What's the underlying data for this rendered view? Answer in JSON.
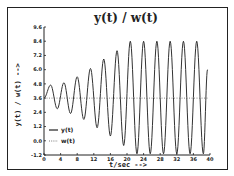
{
  "chart_data": {
    "type": "line",
    "title": "y(t) / w(t)",
    "xlabel": "t/sec -->",
    "ylabel": "y(t) / w(t) -->",
    "xlim": [
      0,
      40
    ],
    "ylim": [
      -1.2,
      9.6
    ],
    "x_ticks": [
      "0",
      "4",
      "8",
      "12",
      "16",
      "20",
      "24",
      "28",
      "32",
      "36",
      "40"
    ],
    "y_ticks": [
      "-1.2",
      "0.0",
      "1.2",
      "2.4",
      "3.6",
      "4.8",
      "6.0",
      "7.2",
      "8.4",
      "9.6"
    ],
    "grid": false,
    "legend_position": "lower left",
    "series": [
      {
        "name": "y(t)",
        "style": "solid",
        "description": "oscillation around 3.6 with amplitude growing from ~1.1 to ~4.8, saturating after t≈20; period ≈3.1 s",
        "x": [
          0,
          1.6,
          3.2,
          4.8,
          6.4,
          8.0,
          9.6,
          11.2,
          12.8,
          14.4,
          16.0,
          17.6,
          19.2,
          20.8,
          22.4,
          24.0,
          25.6,
          27.2,
          28.8,
          30.4,
          32.0,
          33.6,
          35.2,
          36.8,
          38.4,
          39.4
        ],
        "values": [
          3.6,
          4.7,
          2.7,
          4.9,
          2.3,
          5.4,
          1.8,
          6.1,
          1.1,
          6.9,
          0.4,
          7.6,
          -0.4,
          8.4,
          -1.1,
          8.4,
          -1.1,
          8.4,
          -1.1,
          8.4,
          -1.1,
          8.4,
          -1.1,
          8.4,
          -1.1,
          6.0
        ]
      },
      {
        "name": "w(t)",
        "style": "dotted",
        "x": [
          0,
          39.4
        ],
        "values": [
          3.6,
          3.6
        ]
      }
    ]
  }
}
